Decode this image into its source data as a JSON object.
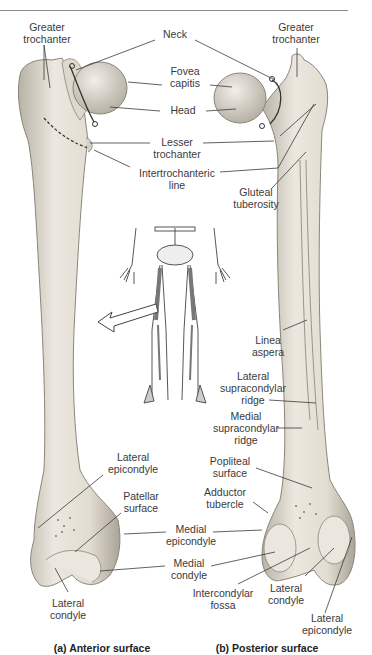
{
  "figure": {
    "captions": {
      "anterior": "(a) Anterior surface",
      "posterior": "(b) Posterior surface"
    },
    "colors": {
      "bone_fill": "#e6e1d7",
      "bone_shadow": "#b8b2a6",
      "bone_outline": "#8c857a",
      "leader_line": "#3a3a3a",
      "label_text": "#3a3a3a"
    },
    "labels": {
      "greater_trochanter_a": [
        "Greater",
        "trochanter"
      ],
      "neck": "Neck",
      "fovea_capitis": [
        "Fovea",
        "capitis"
      ],
      "head": "Head",
      "greater_trochanter_b": [
        "Greater",
        "trochanter"
      ],
      "lesser_trochanter": [
        "Lesser",
        "trochanter"
      ],
      "intertrochanteric_line": [
        "Intertrochanteric",
        "line"
      ],
      "gluteal_tuberosity": [
        "Gluteal",
        "tuberosity"
      ],
      "linea_aspera": [
        "Linea",
        "aspera"
      ],
      "lateral_supracondylar_ridge": [
        "Lateral",
        "supracondylar",
        "ridge"
      ],
      "medial_supracondylar_ridge": [
        "Medial",
        "supracondylar",
        "ridge"
      ],
      "popliteal_surface": [
        "Popliteal",
        "surface"
      ],
      "adductor_tubercle": [
        "Adductor",
        "tubercle"
      ],
      "lateral_epicondyle_a": [
        "Lateral",
        "epicondyle"
      ],
      "patellar_surface": [
        "Patellar",
        "surface"
      ],
      "medial_epicondyle": [
        "Medial",
        "epicondyle"
      ],
      "medial_condyle": [
        "Medial",
        "condyle"
      ],
      "lateral_condyle_a": [
        "Lateral",
        "condyle"
      ],
      "intercondylar_fossa": [
        "Intercondylar",
        "fossa"
      ],
      "lateral_condyle_b": [
        "Lateral",
        "condyle"
      ],
      "lateral_epicondyle_b": [
        "Lateral",
        "epicondyle"
      ]
    },
    "inset": {
      "description": "Skeleton of lower body with femurs highlighted",
      "arrow": "arrow-pointing-left"
    }
  }
}
